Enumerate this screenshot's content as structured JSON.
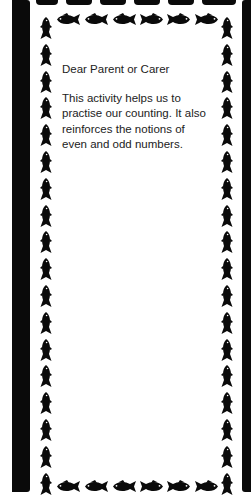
{
  "letter": {
    "greeting": "Dear Parent or Carer",
    "body": "This activity helps us to practise our counting. It also reinforces the notions of even and odd numbers."
  },
  "border": {
    "motif": "fish-icon",
    "color": "#0a0a0a",
    "top_fish_count": 6,
    "bottom_fish_count": 6,
    "left_fish_count": 18,
    "right_fish_count": 18
  }
}
